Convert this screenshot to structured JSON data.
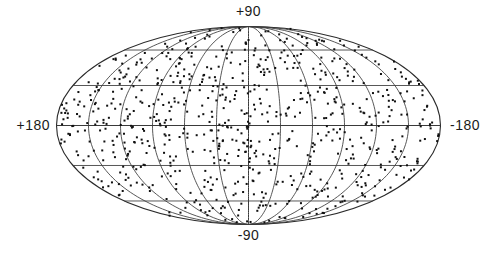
{
  "figure": {
    "background_color": "#ffffff"
  },
  "chart_data": {
    "type": "scatter",
    "projection": "mollweide",
    "title": "",
    "axis_labels": {
      "top": "+90",
      "bottom": "-90",
      "left": "+180",
      "right": "-180"
    },
    "lon_axis": {
      "left_edge_deg": 180,
      "center_deg": 0,
      "right_edge_deg": -180
    },
    "lat_axis": {
      "top_deg": 90,
      "bottom_deg": -90
    },
    "grid": {
      "meridian_step_deg": 30,
      "parallel_step_deg": 30,
      "equator_drawn": true,
      "central_meridian_drawn": true,
      "meridian_count_internal": 11,
      "parallel_count_internal": 5
    },
    "ellipse": {
      "cx": 248.5,
      "cy": 125.5,
      "semi_major": 192,
      "semi_minor": 99
    },
    "points": {
      "count": 780,
      "distribution": "isotropic-uniform-on-sphere",
      "seed": 19870412,
      "marker": "square",
      "marker_size_px": 2,
      "color": "#101010"
    },
    "colors": {
      "grid": "#3a3a3a",
      "outline": "#2a2a2a",
      "label": "#1b1b1b",
      "background": "#ffffff"
    }
  }
}
